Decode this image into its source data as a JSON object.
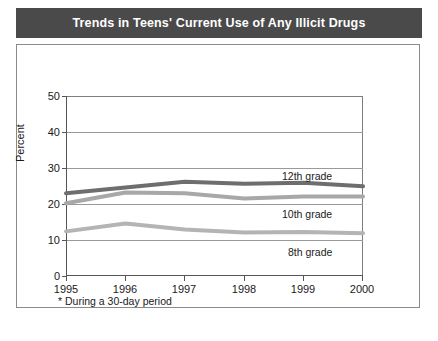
{
  "title": "Trends in Teens' Current Use of Any Illicit Drugs",
  "footnote": "* During a 30-day period",
  "axis": {
    "ylabel": "Percent",
    "yticks": [
      "0",
      "10",
      "20",
      "30",
      "40",
      "50"
    ],
    "xticks": [
      "1995",
      "1996",
      "1997",
      "1998",
      "1999",
      "2000"
    ]
  },
  "labels": {
    "grade12": "12th grade",
    "grade10": "10th grade",
    "grade8": "8th grade"
  },
  "colors": {
    "title_bar": "#4a4a4a",
    "grade12": "#6e6e6e",
    "grade10": "#a8a8a8",
    "grade8": "#b4b4b4",
    "grid": "#9a9a9a",
    "frame": "#8a8a8a"
  },
  "chart_data": {
    "type": "line",
    "title": "Trends in Teens' Current Use of Any Illicit Drugs",
    "xlabel": "",
    "ylabel": "Percent",
    "x": [
      "1995",
      "1996",
      "1997",
      "1998",
      "1999",
      "2000"
    ],
    "categories": [
      "1995",
      "1996",
      "1997",
      "1998",
      "1999",
      "2000"
    ],
    "ylim": [
      0,
      50
    ],
    "yticks": [
      0,
      10,
      20,
      30,
      40,
      50
    ],
    "grid": true,
    "legend": "inline-right-labels",
    "annotation": "* During a 30-day period",
    "series": [
      {
        "name": "12th grade",
        "values": [
          23.0,
          24.6,
          26.2,
          25.6,
          25.9,
          24.9
        ],
        "color": "#6e6e6e"
      },
      {
        "name": "10th grade",
        "values": [
          20.2,
          23.2,
          23.0,
          21.5,
          22.1,
          22.1
        ],
        "color": "#a8a8a8"
      },
      {
        "name": "8th grade",
        "values": [
          12.4,
          14.6,
          12.9,
          12.1,
          12.2,
          11.9
        ],
        "color": "#b4b4b4"
      }
    ]
  }
}
